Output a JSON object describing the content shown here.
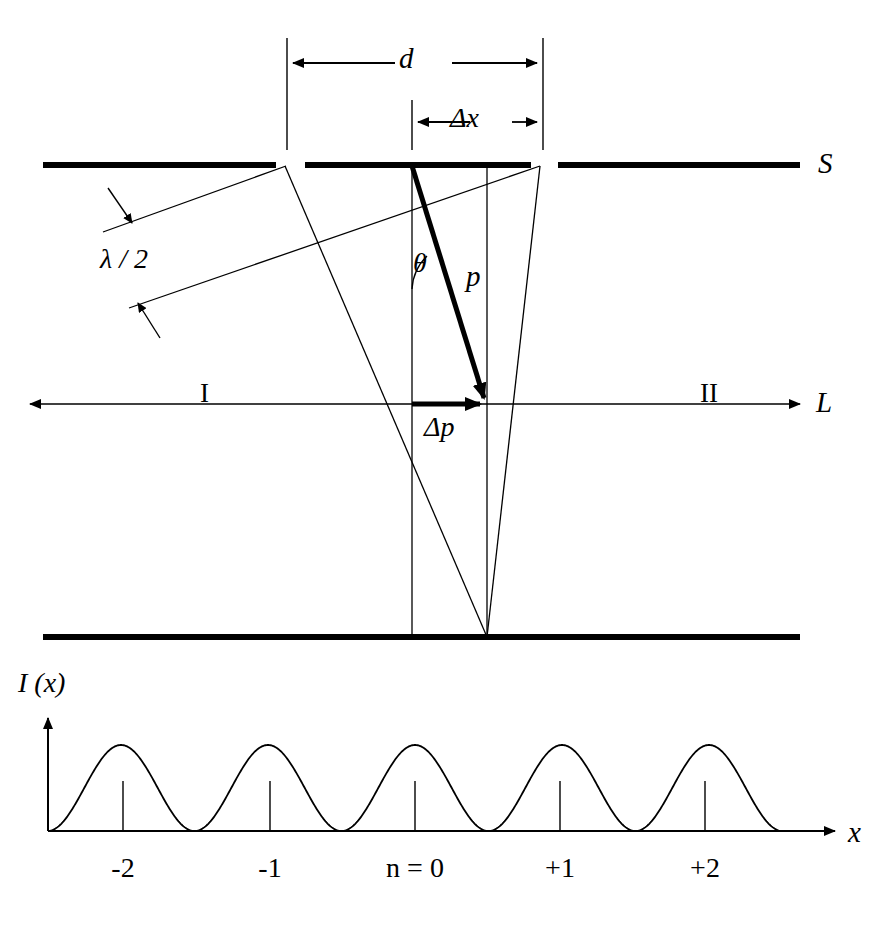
{
  "figure": {
    "stroke_color": "#000000",
    "background": "#ffffff"
  },
  "labels": {
    "slit_separation": "d",
    "fringe_spacing": "Δx",
    "screen_top": "S",
    "half_wavelength": "λ / 2",
    "angle": "θ",
    "momentum": "p",
    "momentum_change": "Δp",
    "region_one": "I",
    "region_two": "II",
    "baseline_axis": "L",
    "intensity_axis": "I (x)",
    "position_axis": "x"
  },
  "chart_data": {
    "type": "line",
    "xlabel": "x",
    "ylabel": "I (x)",
    "tick_labels": [
      "-2",
      "-1",
      "n = 0",
      "+1",
      "+2"
    ],
    "order_numbers": [
      -2,
      -1,
      0,
      1,
      2
    ],
    "peak_positions_px": [
      123,
      270,
      415,
      560,
      705
    ],
    "peak_value": 1,
    "minimum_value": 0,
    "fringe_count": 5,
    "grid": false,
    "legend": false,
    "curve_description": "cos-squared interference fringes, equal amplitude, period equal to tick spacing"
  },
  "geometry": {
    "barrier_top_y": 165,
    "barrier_bottom_y": 637,
    "axis_L_y": 404,
    "slit_1_x": 285,
    "slit_2_x": 540,
    "convergence_x": 487,
    "dimension_d_from": 287,
    "dimension_d_to": 543,
    "dimension_dx_from": 412,
    "dimension_dx_to": 543
  }
}
